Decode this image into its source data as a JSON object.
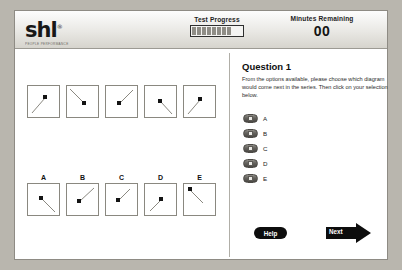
{
  "header": {
    "logo_word": "shl",
    "logo_registered": "®",
    "logo_tagline": "PEOPLE PERFORMANCE",
    "progress_label": "Test Progress",
    "progress_segments": 8,
    "minutes_label": "Minutes Remaining",
    "minutes_value": "00"
  },
  "question": {
    "title": "Question 1",
    "instructions": "From the options available, please choose which diagram would come next in the series. Then click on your selection below.",
    "options": [
      {
        "label": "A"
      },
      {
        "label": "B"
      },
      {
        "label": "C"
      },
      {
        "label": "D"
      },
      {
        "label": "E"
      }
    ]
  },
  "series": [
    {
      "direction": "up-right"
    },
    {
      "direction": "down-right"
    },
    {
      "direction": "down-left"
    },
    {
      "direction": "up-left"
    },
    {
      "direction": "up-right"
    }
  ],
  "answers": [
    {
      "label": "A",
      "direction": "down-right"
    },
    {
      "label": "B",
      "direction": "down-left"
    },
    {
      "label": "C",
      "direction": "down-left"
    },
    {
      "label": "D",
      "direction": "up-left"
    },
    {
      "label": "E",
      "direction": "up-right"
    }
  ],
  "footer": {
    "help_label": "Help",
    "next_label": "Next"
  },
  "colors": {
    "page_background": "#b9b6ae",
    "panel_background": "#ffffff",
    "button_black": "#0d0d0d",
    "box_border": "#8a8880"
  }
}
